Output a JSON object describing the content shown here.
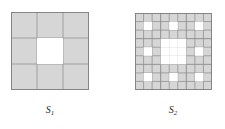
{
  "page": {
    "background_color": "#ffffff",
    "width": 225,
    "height": 129,
    "kind": "mathematical-figure"
  },
  "style": {
    "fill_color": "#d6d6d6",
    "hole_color": "#ffffff",
    "grid_line_color": "#8a8a8a",
    "outer_border_color": "#7d7d7d",
    "label_color": "#2b2b2b"
  },
  "figures": [
    {
      "id": "s1",
      "label_main": "S",
      "label_sub": "1",
      "label_text": "S1",
      "iteration": 1,
      "grid_n": 3,
      "size_px": 78,
      "origin": {
        "x": 11,
        "y": 12
      },
      "holes": [
        {
          "row": 1,
          "col": 1
        }
      ],
      "filled_cell_count": 8,
      "hole_cell_count": 1
    },
    {
      "id": "s2",
      "label_main": "S",
      "label_sub": "2",
      "label_text": "S2",
      "iteration": 2,
      "grid_n": 9,
      "size_px": 77,
      "origin": {
        "x": 135,
        "y": 13
      },
      "holes": [
        {
          "row": 1,
          "col": 1
        },
        {
          "row": 1,
          "col": 4
        },
        {
          "row": 1,
          "col": 7
        },
        {
          "row": 3,
          "col": 3
        },
        {
          "row": 3,
          "col": 4
        },
        {
          "row": 3,
          "col": 5
        },
        {
          "row": 4,
          "col": 1
        },
        {
          "row": 4,
          "col": 3
        },
        {
          "row": 4,
          "col": 4
        },
        {
          "row": 4,
          "col": 5
        },
        {
          "row": 4,
          "col": 7
        },
        {
          "row": 5,
          "col": 3
        },
        {
          "row": 5,
          "col": 4
        },
        {
          "row": 5,
          "col": 5
        },
        {
          "row": 7,
          "col": 1
        },
        {
          "row": 7,
          "col": 4
        },
        {
          "row": 7,
          "col": 7
        }
      ],
      "filled_cell_count": 64,
      "hole_cell_count": 17
    }
  ]
}
